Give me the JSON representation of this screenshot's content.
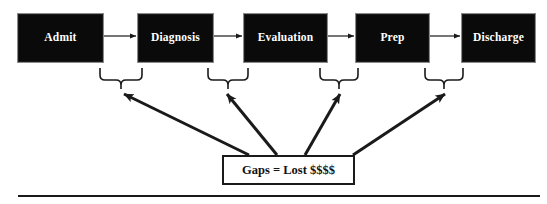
{
  "diagram": {
    "colors": {
      "box_fill": "#0a0a0a",
      "box_border": "#8a8a8a",
      "box_text": "#ffffff",
      "line": "#1a1a1a",
      "gap_box_fill": "#ffffff",
      "gap_box_border": "#1a1a1a",
      "gap_box_text": "#111111",
      "background": "#ffffff"
    },
    "process_steps": [
      {
        "id": "admit",
        "label": "Admit",
        "x": 17,
        "y": 13,
        "w": 87,
        "h": 50
      },
      {
        "id": "diagnosis",
        "label": "Diagnosis",
        "x": 137,
        "y": 13,
        "w": 77,
        "h": 50
      },
      {
        "id": "evaluation",
        "label": "Evaluation",
        "x": 243,
        "y": 13,
        "w": 85,
        "h": 50
      },
      {
        "id": "prep",
        "label": "Prep",
        "x": 355,
        "y": 13,
        "w": 75,
        "h": 50
      },
      {
        "id": "discharge",
        "label": "Discharge",
        "x": 461,
        "y": 13,
        "w": 75,
        "h": 50
      }
    ],
    "flow_arrows": [
      {
        "from": "admit",
        "to": "diagnosis",
        "x1": 104,
        "x2": 136,
        "y": 36
      },
      {
        "from": "diagnosis",
        "to": "evaluation",
        "x1": 214,
        "x2": 242,
        "y": 36
      },
      {
        "from": "evaluation",
        "to": "prep",
        "x1": 328,
        "x2": 354,
        "y": 36
      },
      {
        "from": "prep",
        "to": "discharge",
        "x1": 430,
        "x2": 460,
        "y": 36
      }
    ],
    "gap_braces": [
      {
        "id": "gap-brace-1",
        "left": 100,
        "right": 142,
        "top": 68,
        "tip_x": 121,
        "tip_y": 89
      },
      {
        "id": "gap-brace-2",
        "left": 208,
        "right": 248,
        "top": 68,
        "tip_x": 228,
        "tip_y": 89
      },
      {
        "id": "gap-brace-3",
        "left": 320,
        "right": 358,
        "top": 68,
        "tip_x": 339,
        "tip_y": 89
      },
      {
        "id": "gap-brace-4",
        "left": 425,
        "right": 463,
        "top": 68,
        "tip_x": 444,
        "tip_y": 89
      }
    ],
    "gap_callout": {
      "label": "Gaps = Lost $$$$",
      "x": 222,
      "y": 155,
      "w": 133,
      "h": 30
    },
    "callout_arrows": [
      {
        "id": "callout-arrow-1",
        "x1": 249,
        "y1": 155,
        "x2": 124,
        "y2": 94
      },
      {
        "id": "callout-arrow-2",
        "x1": 277,
        "y1": 155,
        "x2": 227,
        "y2": 94
      },
      {
        "id": "callout-arrow-3",
        "x1": 305,
        "y1": 155,
        "x2": 340,
        "y2": 94
      },
      {
        "id": "callout-arrow-4",
        "x1": 353,
        "y1": 155,
        "x2": 445,
        "y2": 94
      }
    ],
    "footer_rule": {
      "x1": 18,
      "x2": 540,
      "y": 196
    }
  }
}
